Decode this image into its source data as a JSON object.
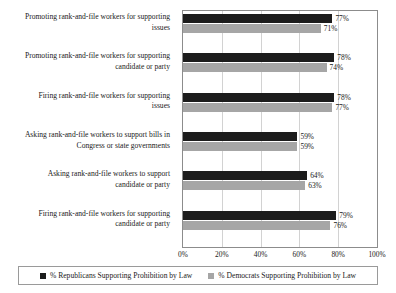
{
  "chart_data": {
    "type": "bar",
    "orientation": "horizontal",
    "title": "",
    "subtitle": "",
    "xlabel": "",
    "ylabel": "",
    "xlim": [
      0,
      100
    ],
    "xticks": [
      "0%",
      "20%",
      "40%",
      "60%",
      "80%",
      "100%"
    ],
    "xtick_values": [
      0,
      20,
      40,
      60,
      80,
      100
    ],
    "grid": true,
    "grid_axis": "x",
    "legend_position": "bottom",
    "categories": [
      "Promoting rank-and-file workers for supporting issues",
      "Promoting rank-and-file workers for supporting candidate or party",
      "Firing rank-and-file workers for supporting issues",
      "Asking rank-and-file workers to support bills in Congress or state governments",
      "Asking rank-and-file workers to support candidate or party",
      "Firing rank-and-file workers for supporting candidate or party"
    ],
    "category_lines": [
      [
        "Promoting rank-and-file workers for supporting",
        "issues"
      ],
      [
        "Promoting rank-and-file workers for supporting",
        "candidate or party"
      ],
      [
        "Firing rank-and-file workers for supporting",
        "issues"
      ],
      [
        "Asking rank-and-file workers to support bills in",
        "Congress or state governments"
      ],
      [
        "Asking rank-and-file workers to support",
        "candidate or party"
      ],
      [
        "Firing rank-and-file workers for supporting",
        "candidate or party"
      ]
    ],
    "series": [
      {
        "name": "% Republicans Supporting Prohibition by Law",
        "key": "rep",
        "color": "#1c1c1c",
        "values": [
          77,
          78,
          78,
          59,
          64,
          79
        ],
        "labels": [
          "77%",
          "78%",
          "78%",
          "59%",
          "64%",
          "79%"
        ]
      },
      {
        "name": "% Democrats Supporting Prohibition by Law",
        "key": "dem",
        "color": "#a6a6a6",
        "values": [
          71,
          74,
          77,
          59,
          63,
          76
        ],
        "labels": [
          "71%",
          "74%",
          "77%",
          "59%",
          "63%",
          "76%"
        ]
      }
    ]
  },
  "legend": {
    "items": [
      {
        "label": "% Republicans Supporting Prohibition by Law",
        "color": "#1c1c1c",
        "key": "rep"
      },
      {
        "label": "% Democrats Supporting Prohibition by Law",
        "color": "#a6a6a6",
        "key": "dem"
      }
    ]
  },
  "colors": {
    "republican": "#1c1c1c",
    "democrat": "#a6a6a6",
    "grid": "#d2d2d2",
    "frame": "#8c8c8c",
    "text": "#1a1a1a",
    "background": "#ffffff"
  }
}
